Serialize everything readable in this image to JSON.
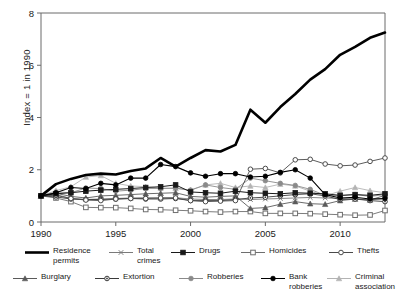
{
  "chart_data": {
    "type": "line",
    "title": "",
    "xlabel": "",
    "ylabel": "Index = 1 in 1990",
    "xlim": [
      1990,
      2013
    ],
    "ylim": [
      0,
      8
    ],
    "xticks": [
      1990,
      1995,
      2000,
      2005,
      2010
    ],
    "yticks": [
      0,
      2,
      4,
      6,
      8
    ],
    "grid": false,
    "legend_position": "bottom",
    "x": [
      1990,
      1991,
      1992,
      1993,
      1994,
      1995,
      1996,
      1997,
      1998,
      1999,
      2000,
      2001,
      2002,
      2003,
      2004,
      2005,
      2006,
      2007,
      2008,
      2009,
      2010,
      2011,
      2012,
      2013
    ],
    "series": [
      {
        "name": "Residence permits",
        "label": "Residence\npermits",
        "marker": "none",
        "color": "#000000",
        "width": 2.6,
        "values": [
          1.0,
          1.45,
          1.65,
          1.8,
          1.85,
          1.82,
          1.95,
          2.05,
          2.45,
          2.12,
          2.45,
          2.75,
          2.7,
          2.95,
          4.3,
          3.8,
          4.4,
          4.9,
          5.45,
          5.85,
          6.4,
          6.7,
          7.05,
          7.25
        ]
      },
      {
        "name": "Total crimes",
        "label": "Total\ncrimes",
        "marker": "x",
        "color": "#7a7a7a",
        "width": 0.9,
        "values": [
          1.0,
          1.05,
          0.9,
          0.86,
          0.88,
          0.9,
          0.92,
          0.93,
          0.92,
          0.93,
          0.88,
          0.86,
          0.86,
          0.88,
          0.86,
          0.88,
          0.9,
          0.92,
          0.94,
          0.92,
          0.9,
          0.88,
          0.86,
          0.88
        ]
      },
      {
        "name": "Drugs",
        "label": "Drugs",
        "marker": "square-filled",
        "color": "#1a1a1a",
        "width": 1.0,
        "values": [
          1.0,
          1.08,
          1.12,
          1.18,
          1.22,
          1.25,
          1.28,
          1.32,
          1.35,
          1.42,
          1.15,
          1.12,
          1.1,
          1.18,
          1.12,
          1.1,
          1.08,
          1.12,
          1.1,
          1.08,
          1.02,
          1.05,
          1.02,
          1.08
        ]
      },
      {
        "name": "Homicides",
        "label": "Homicides",
        "marker": "square-open",
        "color": "#6e6e6e",
        "width": 0.9,
        "values": [
          1.0,
          0.92,
          0.78,
          0.56,
          0.55,
          0.55,
          0.52,
          0.48,
          0.47,
          0.45,
          0.43,
          0.4,
          0.38,
          0.4,
          0.4,
          0.33,
          0.33,
          0.33,
          0.32,
          0.3,
          0.28,
          0.26,
          0.27,
          0.44
        ]
      },
      {
        "name": "Thefts",
        "label": "Thefts",
        "marker": "circle-open",
        "color": "#4a4a4a",
        "width": 0.9,
        "values": [
          1.0,
          1.02,
          0.9,
          0.84,
          0.82,
          0.88,
          0.9,
          0.9,
          0.92,
          0.92,
          0.82,
          0.78,
          0.8,
          0.82,
          2.02,
          2.05,
          1.88,
          2.38,
          2.4,
          2.22,
          2.15,
          2.18,
          2.32,
          2.45
        ]
      },
      {
        "name": "Burglary",
        "label": "Burglary",
        "marker": "triangle-filled",
        "color": "#5a5a5a",
        "width": 0.9,
        "values": [
          1.0,
          1.1,
          0.98,
          0.92,
          1.0,
          1.02,
          1.05,
          1.08,
          1.1,
          1.12,
          0.98,
          0.95,
          0.98,
          1.0,
          0.52,
          0.55,
          0.68,
          0.78,
          0.7,
          0.68,
          0.82,
          0.88,
          0.84,
          1.02
        ]
      },
      {
        "name": "Extortion",
        "label": "Extortion",
        "marker": "circle-dot",
        "color": "#3a3a3a",
        "width": 0.9,
        "values": [
          1.0,
          0.96,
          0.88,
          0.86,
          0.86,
          0.88,
          0.9,
          0.88,
          0.88,
          0.9,
          0.82,
          0.82,
          0.82,
          0.86,
          0.92,
          0.95,
          1.0,
          1.05,
          1.08,
          1.0,
          0.86,
          0.88,
          0.82,
          0.78
        ]
      },
      {
        "name": "Robberies",
        "label": "Robberies",
        "marker": "circle-grey",
        "color": "#8a8a8a",
        "width": 0.9,
        "values": [
          1.0,
          1.15,
          1.12,
          1.3,
          1.28,
          1.18,
          1.22,
          1.28,
          1.28,
          1.3,
          1.22,
          1.42,
          1.32,
          1.25,
          1.68,
          1.58,
          1.48,
          1.4,
          1.25,
          1.02,
          1.0,
          1.05,
          0.98,
          1.05
        ]
      },
      {
        "name": "Bank robberies",
        "label": "Bank\nrobberies",
        "marker": "circle-filled",
        "color": "#000000",
        "width": 1.1,
        "values": [
          1.0,
          1.12,
          1.32,
          1.28,
          1.48,
          1.42,
          1.68,
          1.68,
          2.2,
          2.12,
          1.88,
          1.75,
          1.85,
          1.85,
          1.72,
          1.75,
          1.9,
          2.0,
          1.68,
          1.05,
          0.92,
          0.95,
          0.88,
          0.9
        ]
      },
      {
        "name": "Criminal association",
        "label": "Criminal\nassociation",
        "marker": "triangle-light",
        "color": "#b3b3b3",
        "width": 0.9,
        "values": [
          1.0,
          1.2,
          1.35,
          1.72,
          1.78,
          1.48,
          1.38,
          1.35,
          1.3,
          1.28,
          1.22,
          1.42,
          1.48,
          1.32,
          1.38,
          1.32,
          1.45,
          1.38,
          1.18,
          1.0,
          1.18,
          1.32,
          1.2,
          1.12
        ]
      }
    ]
  },
  "axis": {
    "ylabel": "Index = 1 in 1990",
    "yticks": [
      "0",
      "2",
      "4",
      "6",
      "8"
    ],
    "xticks": [
      "1990",
      "1995",
      "2000",
      "2005",
      "2010"
    ]
  },
  "legend": {
    "row1": [
      {
        "label": "Residence\npermits",
        "series": 0
      },
      {
        "label": "Total\ncrimes",
        "series": 1
      },
      {
        "label": "Drugs",
        "series": 2
      },
      {
        "label": "Homicides",
        "series": 3
      },
      {
        "label": "Thefts",
        "series": 4
      }
    ],
    "row2": [
      {
        "label": "Burglary",
        "series": 5
      },
      {
        "label": "Extortion",
        "series": 6
      },
      {
        "label": "Robberies",
        "series": 7
      },
      {
        "label": "Bank\nrobberies",
        "series": 8
      },
      {
        "label": "Criminal\nassociation",
        "series": 9
      }
    ]
  }
}
